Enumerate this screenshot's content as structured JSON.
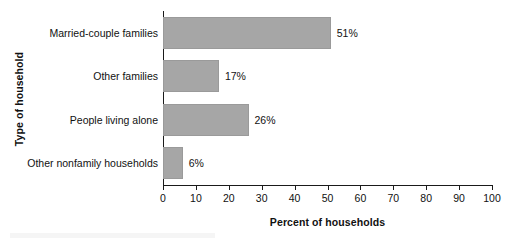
{
  "chart_data": {
    "type": "bar",
    "orientation": "horizontal",
    "title": "",
    "xlabel": "Percent of households",
    "ylabel": "Type of household",
    "categories": [
      "Married-couple families",
      "Other families",
      "People living alone",
      "Other nonfamily households"
    ],
    "values": [
      51,
      17,
      26,
      6
    ],
    "value_labels": [
      "51%",
      "17%",
      "26%",
      "6%"
    ],
    "xlim": [
      0,
      100
    ],
    "xticks": [
      0,
      10,
      20,
      30,
      40,
      50,
      60,
      70,
      80,
      90,
      100
    ],
    "xtick_labels": [
      "0",
      "10",
      "20",
      "30",
      "40",
      "50",
      "60",
      "70",
      "80",
      "90",
      "100"
    ],
    "grid": false,
    "legend": false,
    "colors": {
      "bar_fill": "#a6a6a6",
      "bar_edge": "#9a9a9a",
      "axis": "#1a1a1a",
      "text": "#111111",
      "background": "#ffffff"
    }
  }
}
